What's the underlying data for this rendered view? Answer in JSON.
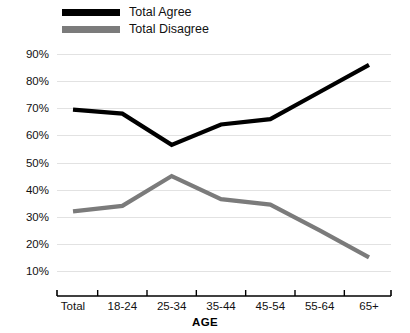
{
  "chart_data": {
    "type": "line",
    "title": "",
    "xlabel": "AGE",
    "ylabel": "",
    "categories": [
      "Total",
      "18-24",
      "25-34",
      "35-44",
      "45-54",
      "55-64",
      "65+"
    ],
    "series": [
      {
        "name": "Total Agree",
        "color": "#000000",
        "values": [
          69.5,
          68,
          56.5,
          64,
          66,
          76,
          86
        ]
      },
      {
        "name": "Total Disagree",
        "color": "#7b7b7b",
        "values": [
          32,
          34,
          45,
          36.5,
          34.5,
          25,
          15
        ]
      }
    ],
    "ylim": [
      5,
      93
    ],
    "yticks": [
      10,
      20,
      30,
      40,
      50,
      60,
      70,
      80,
      90
    ],
    "ytick_labels": [
      "10%",
      "20%",
      "30%",
      "40%",
      "50%",
      "60%",
      "70%",
      "80%",
      "90%"
    ],
    "grid": true,
    "legend_position": "top-left"
  },
  "legend": {
    "items": [
      {
        "label": "Total Agree",
        "color": "#000000"
      },
      {
        "label": "Total Disagree",
        "color": "#7b7b7b"
      }
    ]
  },
  "axes": {
    "x_title": "AGE"
  }
}
